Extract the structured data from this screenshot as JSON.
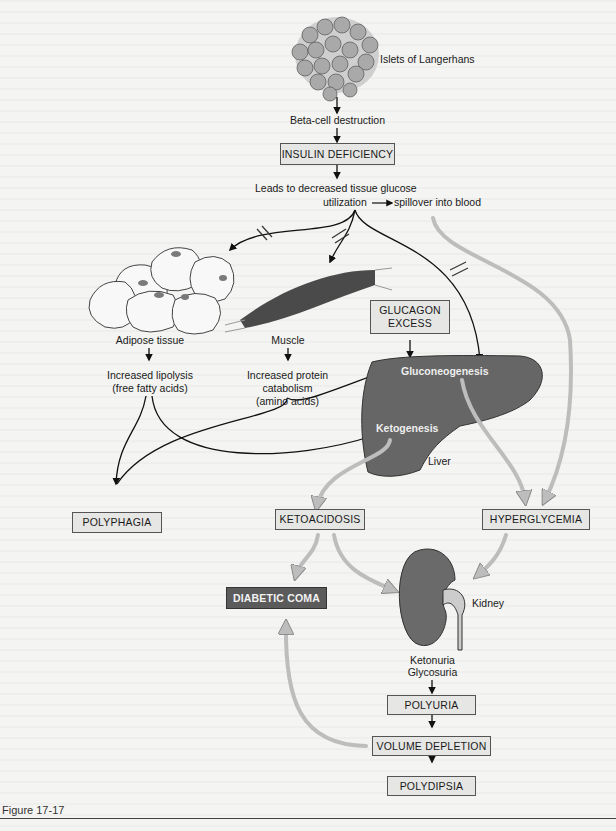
{
  "figure": {
    "caption": "Figure 17-17",
    "colors": {
      "background": "#f4f4f2",
      "box_fill": "#e6e6e4",
      "dark_box_fill": "#5b5b5b",
      "organ_fill": "#6a6a6a",
      "gray_arrow": "#bdbdbd"
    }
  },
  "nodes": {
    "islets": "Islets of Langerhans",
    "beta_cell": "Beta-cell destruction",
    "insulin_deficiency": "INSULIN DEFICIENCY",
    "decreased_utilization_line1": "Leads to decreased tissue glucose",
    "decreased_utilization_line2a": "utilization",
    "decreased_utilization_line2b": "spillover into blood",
    "adipose": "Adipose tissue",
    "lipolysis_line1": "Increased lipolysis",
    "lipolysis_line2": "(free fatty acids)",
    "muscle": "Muscle",
    "protein_line1": "Increased protein",
    "protein_line2": "catabolism",
    "protein_line3": "(amino acids)",
    "glucagon_line1": "GLUCAGON",
    "glucagon_line2": "EXCESS",
    "gluconeogenesis": "Gluconeogenesis",
    "ketogenesis": "Ketogenesis",
    "liver": "Liver",
    "polyphagia": "POLYPHAGIA",
    "ketoacidosis": "KETOACIDOSIS",
    "hyperglycemia": "HYPERGLYCEMIA",
    "diabetic_coma": "DIABETIC COMA",
    "kidney": "Kidney",
    "ketonuria": "Ketonuria",
    "glycosuria": "Glycosuria",
    "polyuria": "POLYURIA",
    "volume_depletion": "VOLUME DEPLETION",
    "polydipsia": "POLYDIPSIA"
  }
}
